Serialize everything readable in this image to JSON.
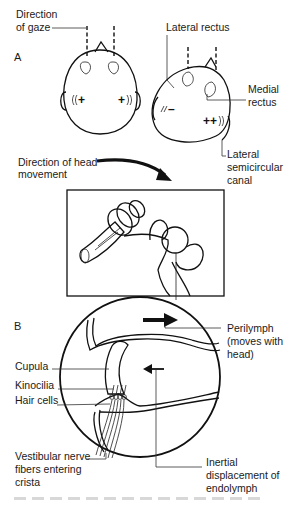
{
  "figure": {
    "panels": {
      "a": "A",
      "b": "B"
    },
    "labels": {
      "direction_of_gaze": [
        "Direction",
        "of gaze"
      ],
      "lateral_rectus": "Lateral rectus",
      "medial_rectus": [
        "Medial",
        "rectus"
      ],
      "lateral_semicircular_canal": [
        "Lateral",
        "semicircular",
        "canal"
      ],
      "direction_of_head_movement": [
        "Direction of head",
        "movement"
      ],
      "perilymph": [
        "Perilymph",
        "(moves with",
        "head)"
      ],
      "cupula": "Cupula",
      "kinocilia": "Kinocilia",
      "hair_cells": "Hair cells",
      "vestibular_nerve": [
        "Vestibular nerve",
        "fibers entering",
        "crista"
      ],
      "inertial_displacement": [
        "Inertial",
        "displacement of",
        "endolymph"
      ]
    },
    "signs": {
      "left_head_left_ear": "+",
      "left_head_right_ear": "+",
      "right_head_left_ear": "–",
      "right_head_right_ear": "++"
    },
    "icons": {
      "head_movement_arrow": "curved-arrow-right",
      "perilymph_arrow": "arrow-right",
      "endolymph_arrow": "arrow-left"
    }
  }
}
